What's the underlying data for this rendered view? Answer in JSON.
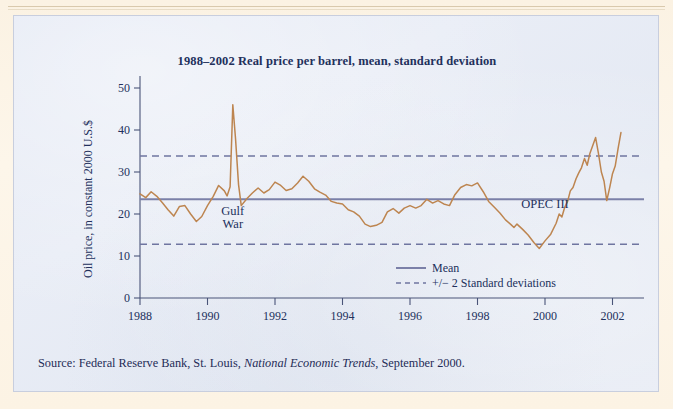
{
  "figure": {
    "title": "1988–2002 Real price per barrel, mean, standard deviation",
    "source_prefix": "Source: Federal Reserve Bank, St. Louis, ",
    "source_italic": "National Economic Trends",
    "source_suffix": ", September 2000."
  },
  "colors": {
    "page": "#fbf2e3",
    "panel": "#e5eaf4",
    "panel_border": "#c8cede",
    "series": "#bd8550",
    "mean_line": "#7b80a8",
    "band_line": "#6f75a0",
    "axis": "#4a5478",
    "text": "#22305c"
  },
  "chart_data": {
    "type": "line",
    "title": "1988–2002 Real price per barrel, mean, standard deviation",
    "xlabel": "",
    "ylabel": "Oil price, in constant 2000 U.S.$",
    "xlim": [
      1988,
      2002.4
    ],
    "ylim": [
      0,
      50
    ],
    "xticks": [
      1988,
      1990,
      1992,
      1994,
      1996,
      1998,
      2000,
      2002
    ],
    "xtick_labels": [
      "1988",
      "1990",
      "1992",
      "1994",
      "1996",
      "1998",
      "2000",
      "2002"
    ],
    "yticks": [
      0,
      10,
      20,
      30,
      40,
      50
    ],
    "ytick_labels": [
      "0",
      "10",
      "20",
      "30",
      "40",
      "50"
    ],
    "grid": false,
    "legend_position": "center-right-inside",
    "legend": [
      {
        "label": "Mean",
        "style": "solid",
        "color": "#7b80a8"
      },
      {
        "label": "+/− 2 Standard deviations",
        "style": "dashed",
        "color": "#6f75a0"
      }
    ],
    "reference_lines": [
      {
        "name": "mean",
        "value": 23.5,
        "style": "solid"
      },
      {
        "name": "upper_2sd",
        "value": 33.8,
        "style": "dashed"
      },
      {
        "name": "lower_2sd",
        "value": 12.8,
        "style": "dashed"
      }
    ],
    "annotations": [
      {
        "text": "Gulf",
        "x": 1990.75,
        "y": 19.8
      },
      {
        "text": "War",
        "x": 1990.75,
        "y": 16.6
      },
      {
        "text": "OPEC III",
        "x": 2000.0,
        "y": 21.5
      }
    ],
    "series": [
      {
        "name": "Real price per barrel",
        "color": "#bd8550",
        "x": [
          1988.0,
          1988.17,
          1988.33,
          1988.5,
          1988.67,
          1988.83,
          1989.0,
          1989.17,
          1989.33,
          1989.5,
          1989.67,
          1989.83,
          1990.0,
          1990.17,
          1990.33,
          1990.5,
          1990.58,
          1990.67,
          1990.75,
          1990.83,
          1990.92,
          1991.0,
          1991.17,
          1991.33,
          1991.5,
          1991.67,
          1991.83,
          1992.0,
          1992.17,
          1992.33,
          1992.5,
          1992.67,
          1992.83,
          1993.0,
          1993.17,
          1993.33,
          1993.5,
          1993.67,
          1993.83,
          1994.0,
          1994.17,
          1994.33,
          1994.5,
          1994.67,
          1994.83,
          1995.0,
          1995.17,
          1995.33,
          1995.5,
          1995.67,
          1995.83,
          1996.0,
          1996.17,
          1996.33,
          1996.5,
          1996.67,
          1996.83,
          1997.0,
          1997.17,
          1997.33,
          1997.5,
          1997.67,
          1997.83,
          1998.0,
          1998.17,
          1998.33,
          1998.5,
          1998.67,
          1998.83,
          1999.0,
          1999.08,
          1999.17,
          1999.33,
          1999.5,
          1999.67,
          1999.83,
          2000.0,
          2000.17,
          2000.33,
          2000.42,
          2000.5,
          2000.58,
          2000.67,
          2000.75,
          2000.83,
          2000.92,
          2001.0,
          2001.08,
          2001.17,
          2001.25,
          2001.33,
          2001.5,
          2001.58,
          2001.67,
          2001.75,
          2001.83,
          2001.92,
          2002.0,
          2002.08,
          2002.17,
          2002.25
        ],
        "y": [
          24.8,
          23.9,
          25.3,
          24.2,
          22.6,
          21.0,
          19.5,
          21.8,
          22.0,
          20.0,
          18.2,
          19.4,
          22.0,
          24.2,
          26.8,
          25.5,
          24.3,
          26.5,
          46.0,
          38.0,
          27.0,
          22.0,
          23.7,
          25.0,
          26.2,
          25.0,
          25.8,
          27.6,
          26.8,
          25.6,
          26.0,
          27.4,
          29.0,
          27.8,
          26.0,
          25.2,
          24.5,
          23.0,
          22.6,
          22.4,
          21.0,
          20.5,
          19.5,
          17.6,
          17.0,
          17.3,
          18.0,
          20.5,
          21.3,
          20.2,
          21.4,
          22.0,
          21.4,
          22.0,
          23.5,
          22.6,
          23.2,
          22.4,
          22.0,
          24.6,
          26.3,
          27.0,
          26.7,
          27.4,
          25.3,
          23.0,
          21.6,
          20.2,
          18.6,
          17.4,
          16.8,
          17.6,
          16.4,
          15.0,
          13.2,
          11.8,
          13.6,
          15.2,
          17.8,
          20.0,
          19.3,
          21.5,
          23.0,
          25.5,
          26.3,
          28.4,
          29.8,
          31.0,
          33.2,
          31.6,
          34.4,
          38.2,
          34.6,
          30.0,
          27.8,
          23.2,
          26.4,
          29.6,
          31.4,
          35.8,
          39.4
        ]
      }
    ]
  }
}
